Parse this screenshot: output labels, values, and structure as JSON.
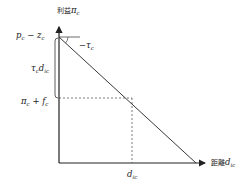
{
  "diagram": {
    "y_axis": {
      "label_cjk": "利益",
      "label_math": "π",
      "label_sub": "c"
    },
    "x_axis": {
      "label_cjk": "距離",
      "label_math": "d",
      "label_sub": "ic"
    },
    "labels": {
      "top_value_main": "p",
      "top_value_sub": "c",
      "top_value_minus": " − z",
      "top_value_sub2": "c",
      "slope_main": "−τ",
      "slope_sub": "c",
      "bracket_main": "τ",
      "bracket_sub": "c",
      "bracket_main2": "d",
      "bracket_sub2": "ic",
      "mid_value_main": "π",
      "mid_value_sub": "c",
      "mid_value_plus": " + f",
      "mid_value_sub2": "c",
      "x_marker_main": "d",
      "x_marker_sub": "ic"
    },
    "colors": {
      "line": "#222222",
      "dash": "#444444",
      "background": "#ffffff"
    }
  }
}
